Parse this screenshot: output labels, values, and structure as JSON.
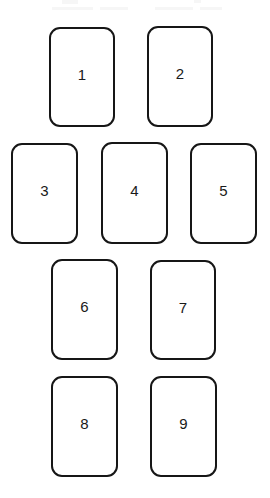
{
  "page": {
    "background_color": "#ffffff",
    "width": 270,
    "height": 498
  },
  "style": {
    "card_fill": "#ffffff",
    "card_stroke": "#161616",
    "label_color": "#1a1a1a",
    "stroke_width": 2,
    "corner_radius": 11
  },
  "cards": [
    {
      "label": "1",
      "x": 49,
      "y": 27,
      "w": 66,
      "h": 100
    },
    {
      "label": "2",
      "x": 147,
      "y": 26,
      "w": 66,
      "h": 101
    },
    {
      "label": "3",
      "x": 11,
      "y": 143,
      "w": 67,
      "h": 101
    },
    {
      "label": "4",
      "x": 101,
      "y": 142,
      "w": 67,
      "h": 102
    },
    {
      "label": "5",
      "x": 190,
      "y": 143,
      "w": 67,
      "h": 101
    },
    {
      "label": "6",
      "x": 51,
      "y": 259,
      "w": 67,
      "h": 101
    },
    {
      "label": "7",
      "x": 150,
      "y": 260,
      "w": 66,
      "h": 100
    },
    {
      "label": "8",
      "x": 51,
      "y": 376,
      "w": 67,
      "h": 101
    },
    {
      "label": "9",
      "x": 150,
      "y": 376,
      "w": 67,
      "h": 101
    }
  ],
  "artifacts": [
    {
      "x": 62,
      "y": 0,
      "w": 16,
      "h": 4
    },
    {
      "x": 194,
      "y": 0,
      "w": 7,
      "h": 3
    },
    {
      "x": 52,
      "y": 7,
      "w": 41,
      "h": 3
    },
    {
      "x": 100,
      "y": 7,
      "w": 28,
      "h": 3
    },
    {
      "x": 155,
      "y": 7,
      "w": 38,
      "h": 3
    },
    {
      "x": 200,
      "y": 7,
      "w": 22,
      "h": 3
    }
  ]
}
